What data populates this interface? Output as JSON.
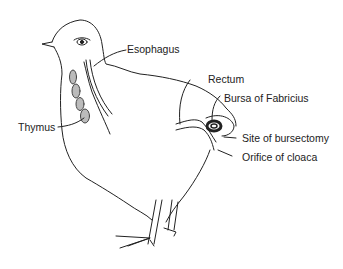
{
  "diagram": {
    "colors": {
      "ink": "#222222",
      "background": "#ffffff",
      "hatch": "#777777"
    },
    "labels": {
      "esophagus": "Esophagus",
      "thymus": "Thymus",
      "rectum": "Rectum",
      "bursa": "Bursa of Fabricius",
      "bursectomy": "Site of bursectomy",
      "cloaca": "Orifice of cloaca"
    }
  }
}
